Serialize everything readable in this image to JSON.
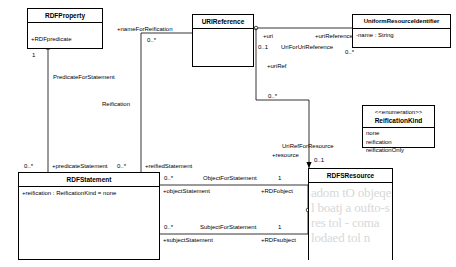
{
  "diagram": {
    "type": "uml-class-diagram"
  },
  "classes": {
    "rdf_property": {
      "name": "RDFProperty",
      "attributes": [
        "+RDFpredicate"
      ]
    },
    "uri_reference": {
      "name": "URIReference",
      "attributes": []
    },
    "uniform_resource_identifier": {
      "name": "UniformResourceIdentifier",
      "attributes": [
        "-name : String"
      ]
    },
    "reification_kind": {
      "stereotype": "<<enumeration>>",
      "name": "ReificationKind",
      "literals": [
        "none",
        "reification",
        "reificationOnly"
      ]
    },
    "rdf_statement": {
      "name": "RDFStatement",
      "attributes": [
        "+reification : ReificationKind = none"
      ]
    },
    "rdfs_resource": {
      "name": "RDFSResource",
      "attributes": []
    }
  },
  "associations": {
    "predicate_for_statement": {
      "name": "PredicateForStatement",
      "source_mult": "1",
      "target_mult": "0..*",
      "target_role": "+predicateStatement"
    },
    "reification": {
      "name": "Reification",
      "source_mult": "0..*",
      "source_role": "+nameForReification",
      "target_mult": "0..*",
      "target_role": "+reifiedStatement"
    },
    "uri_for_uri_reference": {
      "name": "UriForUriReference",
      "source_role": "+uri",
      "source_mult": "0..1",
      "target_role": "+uriReference",
      "target_mult": "0..*"
    },
    "uri_ref_for_resource": {
      "name": "UriRefForResource",
      "source_role": "+uriRef",
      "source_mult": "0..*",
      "target_role": "+resource",
      "target_mult": "0..1"
    },
    "object_for_statement": {
      "name": "ObjectForStatement",
      "source_mult": "0..*",
      "source_role": "+objectStatement",
      "target_mult": "1",
      "target_role": "+RDFobject"
    },
    "subject_for_statement": {
      "name": "SubjectForStatement",
      "source_mult": "0..*",
      "source_role": "+subjectStatement",
      "target_mult": "1",
      "target_role": "+RDFsubject"
    }
  },
  "watermark": {
    "line1": "adom tO objeqe",
    "line2": "l boatj a oufto-s",
    "line3": "res tol - coma",
    "line4": "lodaed tol n"
  }
}
